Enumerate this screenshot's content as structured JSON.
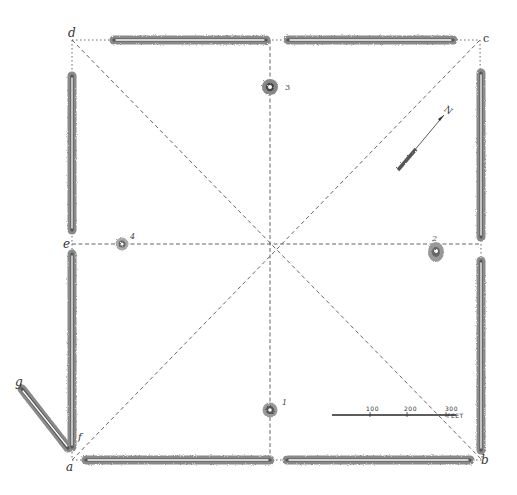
{
  "diagram": {
    "type": "archaeological-earthwork-plan",
    "corners": {
      "a": {
        "label": "a",
        "x": 72,
        "y": 460
      },
      "b": {
        "label": "b",
        "x": 482,
        "y": 460
      },
      "c": {
        "label": "c",
        "x": 480,
        "y": 40
      },
      "d": {
        "label": "d",
        "x": 72,
        "y": 40
      }
    },
    "midpoint_e": {
      "label": "e",
      "x": 72,
      "y": 244
    },
    "wing": {
      "start_label": "g",
      "end_label": "f"
    },
    "mounds": [
      {
        "id": "1",
        "label": "1",
        "x": 270,
        "y": 410
      },
      {
        "id": "2",
        "label": "2",
        "x": 436,
        "y": 252
      },
      {
        "id": "3",
        "label": "3",
        "x": 270,
        "y": 87
      },
      {
        "id": "4",
        "label": "4",
        "x": 122,
        "y": 244
      }
    ],
    "north_arrow": {
      "label": "N"
    },
    "scale_bar": {
      "ticks": [
        "100",
        "200",
        "300"
      ],
      "unit": "FEET"
    },
    "colors": {
      "wall_fill": "#8a8a8a",
      "wall_core": "#ffffff",
      "line": "#555555",
      "background": "#ffffff"
    }
  }
}
